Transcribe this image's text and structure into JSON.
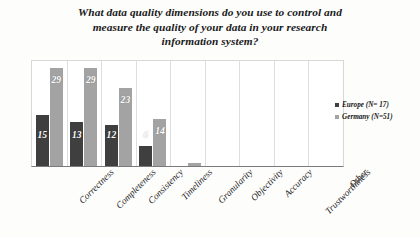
{
  "chart_data": {
    "type": "bar",
    "title": "What data quality dimensions do you use to control and measure the quality of your data in your research information system?",
    "title_lines": [
      "What data quality dimensions do you use to control and",
      "measure the quality of your data in your research",
      "information system?"
    ],
    "xlabel": "",
    "ylabel": "",
    "ylim": [
      0,
      31
    ],
    "grid": "vertical",
    "legend_position": "right",
    "categories": [
      "Correctness",
      "Completeness",
      "Consistency",
      "Timeliness",
      "Granularity",
      "Objectivity",
      "Accuracy",
      "Trustworthiness",
      "Other"
    ],
    "series": [
      {
        "name": "Europe (N= 17)",
        "color": "#3f3f3f",
        "values": [
          15,
          13,
          12,
          6,
          0,
          0,
          0,
          0,
          0
        ],
        "labels": [
          "15",
          "13",
          "12",
          "6",
          "",
          "",
          "",
          "",
          ""
        ]
      },
      {
        "name": "Germany (N=51)",
        "color": "#a3a3a3",
        "values": [
          29,
          29,
          23,
          14,
          1,
          0,
          0,
          0,
          0
        ],
        "labels": [
          "29",
          "29",
          "23",
          "14",
          "",
          "",
          "",
          "",
          ""
        ]
      }
    ]
  },
  "legend": {
    "items": [
      {
        "label": "Europe (N= 17)",
        "color": "#3f3f3f"
      },
      {
        "label": "Germany (N=51)",
        "color": "#a3a3a3"
      }
    ]
  }
}
